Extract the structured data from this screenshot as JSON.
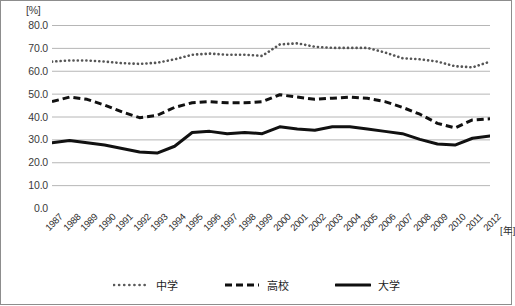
{
  "chart_data": {
    "type": "line",
    "title": "",
    "subtitle": "",
    "xlabel": "[年]",
    "ylabel": "[%]",
    "ylim": [
      0.0,
      80.0
    ],
    "yticks": [
      "80.0",
      "70.0",
      "60.0",
      "50.0",
      "40.0",
      "30.0",
      "20.0",
      "10.0",
      "0.0"
    ],
    "ytick_values": [
      80.0,
      70.0,
      60.0,
      50.0,
      40.0,
      30.0,
      20.0,
      10.0,
      0.0
    ],
    "grid": true,
    "legend_position": "bottom",
    "categories": [
      "1987",
      "1988",
      "1989",
      "1990",
      "1991",
      "1992",
      "1993",
      "1994",
      "1995",
      "1996",
      "1997",
      "1998",
      "1999",
      "2000",
      "2001",
      "2002",
      "2003",
      "2004",
      "2005",
      "2006",
      "2007",
      "2008",
      "2009",
      "2010",
      "2011",
      "2012"
    ],
    "series": [
      {
        "name": "中学",
        "style": "dotted",
        "color": "#555555",
        "values": [
          64.0,
          64.5,
          64.5,
          64.0,
          63.3,
          63.0,
          63.5,
          65.0,
          67.0,
          67.5,
          67.0,
          67.0,
          66.5,
          71.5,
          72.0,
          70.5,
          70.0,
          70.0,
          70.0,
          68.0,
          65.5,
          65.0,
          64.0,
          62.0,
          61.5,
          64.0
        ]
      },
      {
        "name": "高校",
        "style": "dashed",
        "color": "#111111",
        "values": [
          46.5,
          48.5,
          47.5,
          45.0,
          42.0,
          39.5,
          40.5,
          44.0,
          46.0,
          46.5,
          46.0,
          46.0,
          46.5,
          49.5,
          48.5,
          47.5,
          48.0,
          48.5,
          48.0,
          46.5,
          44.0,
          41.0,
          37.0,
          35.0,
          38.5,
          39.0
        ]
      },
      {
        "name": "大学",
        "style": "solid",
        "color": "#111111",
        "values": [
          28.5,
          29.5,
          28.5,
          27.5,
          26.0,
          24.5,
          24.0,
          27.0,
          33.0,
          33.5,
          32.5,
          33.0,
          32.5,
          35.5,
          34.5,
          34.0,
          35.5,
          35.5,
          34.5,
          33.5,
          32.5,
          30.0,
          28.0,
          27.5,
          30.5,
          31.5
        ]
      }
    ]
  },
  "legend": {
    "items": [
      {
        "label": "中学",
        "style": "dotted"
      },
      {
        "label": "高校",
        "style": "dashed"
      },
      {
        "label": "大学",
        "style": "solid"
      }
    ]
  }
}
